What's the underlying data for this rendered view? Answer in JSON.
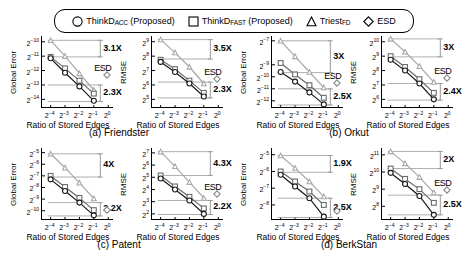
{
  "legend": {
    "items": [
      {
        "marker": "circle",
        "label_main": "ThinkD",
        "label_sub": "ACC",
        "label_tail": " (Proposed)",
        "name": "legend-thinkd-acc"
      },
      {
        "marker": "square",
        "label_main": "ThinkD",
        "label_sub": "FAST",
        "label_tail": " (Proposed)",
        "name": "legend-thinkd-fast"
      },
      {
        "marker": "triangle",
        "label_main": "Triest",
        "label_sub": "FD",
        "label_tail": "",
        "name": "legend-triest-fd"
      },
      {
        "marker": "diamond",
        "label_main": "ESD",
        "label_sub": "",
        "label_tail": "",
        "name": "legend-esd"
      }
    ]
  },
  "captions": {
    "a": "(a) Friendster",
    "b": "(b) Orkut",
    "c": "(c) Patent",
    "d": "(d) BerkStan"
  },
  "axis": {
    "xlabel": "Ratio of Stored Edges",
    "ylabel_error": "Global Error",
    "ylabel_rmse": "RMSE",
    "xticks": [
      "2⁻⁴",
      "2⁻³",
      "2⁻²",
      "2⁻¹",
      "2⁰"
    ],
    "xtick_exponents": [
      -4,
      -3,
      -2,
      -1,
      0
    ]
  },
  "colors": {
    "thinkd_acc": "#1a1a1a",
    "thinkd_fast": "#6b6b6b",
    "triest_fd": "#a8a8a8",
    "esd": "#8c8c8c",
    "annotation": "#9a9a9a",
    "axis": "#000000"
  },
  "chart_data": [
    {
      "id": "friendster-global-error",
      "type": "line",
      "title": "",
      "xlabel": "Ratio of Stored Edges",
      "ylabel": "Global Error",
      "x": [
        -4,
        -3,
        -2,
        -1
      ],
      "xlim": [
        -4.6,
        0.4
      ],
      "yticks": [
        -10,
        -11,
        -12,
        -13,
        -14
      ],
      "ylim": [
        -14.6,
        -9.6
      ],
      "series": [
        {
          "name": "ThinkD_ACC",
          "marker": "circle",
          "values": [
            -11.15,
            -12.15,
            -13.1,
            -14.1
          ]
        },
        {
          "name": "ThinkD_FAST",
          "marker": "square",
          "values": [
            -11.05,
            -11.85,
            -12.7,
            -13.6
          ]
        },
        {
          "name": "Triest_FD",
          "marker": "triangle",
          "values": [
            -9.9,
            -11.0,
            -12.2,
            -13.35
          ]
        },
        {
          "name": "ESD",
          "marker": "diamond",
          "values": [
            null,
            null,
            null,
            null
          ]
        }
      ],
      "annotations": [
        {
          "text": "3.1X",
          "bracket_top": -9.9,
          "bracket_bottom": -11.05
        },
        {
          "text": "2.3X",
          "bracket_top": -13.0,
          "bracket_bottom": -14.15
        }
      ],
      "esd_offscale": {
        "label": "ESD",
        "x": 0,
        "y": -11.9
      }
    },
    {
      "id": "friendster-rmse",
      "type": "line",
      "title": "",
      "xlabel": "Ratio of Stored Edges",
      "ylabel": "RMSE",
      "x": [
        -4,
        -3,
        -2,
        -1
      ],
      "xlim": [
        -4.6,
        0.4
      ],
      "yticks": [
        9,
        8,
        7,
        6,
        5
      ],
      "ylim": [
        4.4,
        9.4
      ],
      "series": [
        {
          "name": "ThinkD_ACC",
          "marker": "circle",
          "values": [
            7.6,
            6.9,
            6.1,
            5.2
          ]
        },
        {
          "name": "ThinkD_FAST",
          "marker": "square",
          "values": [
            7.75,
            7.1,
            6.3,
            5.45
          ]
        },
        {
          "name": "Triest_FD",
          "marker": "triangle",
          "values": [
            9.15,
            8.25,
            7.25,
            6.1
          ]
        },
        {
          "name": "ESD",
          "marker": "diamond",
          "values": [
            null,
            null,
            null,
            null
          ]
        }
      ],
      "annotations": [
        {
          "text": "3.5X",
          "bracket_top": 9.15,
          "bracket_bottom": 7.8
        },
        {
          "text": "2.3X",
          "bracket_top": 6.2,
          "bracket_bottom": 5.1
        }
      ],
      "esd_offscale": {
        "label": "ESD",
        "x": 0,
        "y": 6.8
      }
    },
    {
      "id": "orkut-global-error",
      "type": "line",
      "title": "",
      "xlabel": "Ratio of Stored Edges",
      "ylabel": "Global Error",
      "x": [
        -4,
        -3,
        -2,
        -1
      ],
      "xlim": [
        -4.6,
        0.4
      ],
      "yticks": [
        -7,
        -9,
        -10,
        -11,
        -12
      ],
      "ylim": [
        -12.6,
        -6.6
      ],
      "series": [
        {
          "name": "ThinkD_ACC",
          "marker": "circle",
          "values": [
            -9.6,
            -10.4,
            -11.3,
            -12.3
          ]
        },
        {
          "name": "ThinkD_FAST",
          "marker": "square",
          "values": [
            -8.85,
            -9.8,
            -10.7,
            -11.75
          ]
        },
        {
          "name": "Triest_FD",
          "marker": "triangle",
          "values": [
            -7.0,
            -8.3,
            -9.6,
            -10.9
          ]
        },
        {
          "name": "ESD",
          "marker": "diamond",
          "values": [
            null,
            null,
            null,
            null
          ]
        }
      ],
      "annotations": [
        {
          "text": "3X",
          "bracket_top": -7.0,
          "bracket_bottom": -9.65
        },
        {
          "text": "2.5X",
          "bracket_top": -11.0,
          "bracket_bottom": -12.35
        }
      ],
      "esd_offscale": {
        "label": "ESD",
        "x": 0,
        "y": -10.0
      }
    },
    {
      "id": "orkut-rmse",
      "type": "line",
      "title": "",
      "xlabel": "Ratio of Stored Edges",
      "ylabel": "RMSE",
      "x": [
        -4,
        -3,
        -2,
        -1
      ],
      "xlim": [
        -4.6,
        0.4
      ],
      "yticks": [
        10,
        9,
        8,
        7,
        6
      ],
      "ylim": [
        5.4,
        10.4
      ],
      "series": [
        {
          "name": "ThinkD_ACC",
          "marker": "circle",
          "values": [
            8.75,
            8.0,
            7.1,
            6.0
          ]
        },
        {
          "name": "ThinkD_FAST",
          "marker": "square",
          "values": [
            9.0,
            8.25,
            7.4,
            6.45
          ]
        },
        {
          "name": "Triest_FD",
          "marker": "triangle",
          "values": [
            10.2,
            9.3,
            8.3,
            7.2
          ]
        },
        {
          "name": "ESD",
          "marker": "diamond",
          "values": [
            null,
            null,
            null,
            null
          ]
        }
      ],
      "annotations": [
        {
          "text": "3X",
          "bracket_top": 10.2,
          "bracket_bottom": 8.95
        },
        {
          "text": "2.4X",
          "bracket_top": 7.1,
          "bracket_bottom": 5.95
        }
      ],
      "esd_offscale": {
        "label": "ESD",
        "x": 0,
        "y": 7.9
      }
    },
    {
      "id": "patent-global-error",
      "type": "line",
      "title": "",
      "xlabel": "Ratio of Stored Edges",
      "ylabel": "Global Error",
      "x": [
        -4,
        -3,
        -2,
        -1
      ],
      "xlim": [
        -4.6,
        0.4
      ],
      "yticks": [
        -5,
        -6,
        -7,
        -8,
        -9,
        -10
      ],
      "ylim": [
        -10.8,
        -4.6
      ],
      "series": [
        {
          "name": "ThinkD_ACC",
          "marker": "circle",
          "values": [
            -7.3,
            -8.3,
            -9.3,
            -10.4
          ]
        },
        {
          "name": "ThinkD_FAST",
          "marker": "square",
          "values": [
            -7.0,
            -7.95,
            -8.9,
            -9.95
          ]
        },
        {
          "name": "Triest_FD",
          "marker": "triangle",
          "values": [
            -5.1,
            -6.3,
            -7.6,
            -8.95
          ]
        },
        {
          "name": "ESD",
          "marker": "diamond",
          "values": [
            null,
            null,
            null,
            null
          ]
        }
      ],
      "annotations": [
        {
          "text": "4X",
          "bracket_top": -5.1,
          "bracket_bottom": -7.1
        },
        {
          "text": "2.2X",
          "bracket_top": -9.3,
          "bracket_bottom": -10.45
        }
      ],
      "esd_offscale": {
        "label": "",
        "x": 0,
        "y": -9.4
      }
    },
    {
      "id": "patent-rmse",
      "type": "line",
      "title": "",
      "xlabel": "Ratio of Stored Edges",
      "ylabel": "RMSE",
      "x": [
        -4,
        -3,
        -2,
        -1
      ],
      "xlim": [
        -4.6,
        0.4
      ],
      "yticks": [
        7,
        6,
        5,
        4,
        3,
        2
      ],
      "ylim": [
        1.5,
        7.4
      ],
      "series": [
        {
          "name": "ThinkD_ACC",
          "marker": "circle",
          "values": [
            4.9,
            4.0,
            3.1,
            2.0
          ]
        },
        {
          "name": "ThinkD_FAST",
          "marker": "square",
          "values": [
            5.15,
            4.25,
            3.4,
            2.45
          ]
        },
        {
          "name": "Triest_FD",
          "marker": "triangle",
          "values": [
            7.1,
            5.9,
            4.6,
            3.3
          ]
        },
        {
          "name": "ESD",
          "marker": "diamond",
          "values": [
            null,
            null,
            null,
            null
          ]
        }
      ],
      "annotations": [
        {
          "text": "4.3X",
          "bracket_top": 7.1,
          "bracket_bottom": 5.15
        },
        {
          "text": "2.2X",
          "bracket_top": 3.1,
          "bracket_bottom": 1.95
        }
      ],
      "esd_offscale": {
        "label": "ESD",
        "x": 0,
        "y": 4.1
      }
    },
    {
      "id": "berkstan-global-error",
      "type": "line",
      "title": "",
      "xlabel": "Ratio of Stored Edges",
      "ylabel": "Global Error",
      "x": [
        -4,
        -3,
        -2,
        -1
      ],
      "xlim": [
        -4.6,
        0.4
      ],
      "yticks": [
        -5,
        -6,
        -7,
        -8
      ],
      "ylim": [
        -8.9,
        -4.6
      ],
      "series": [
        {
          "name": "ThinkD_ACC",
          "marker": "circle",
          "values": [
            -6.2,
            -6.9,
            -7.6,
            -8.7
          ]
        },
        {
          "name": "ThinkD_FAST",
          "marker": "square",
          "values": [
            -6.0,
            -6.6,
            -7.2,
            -8.0
          ]
        },
        {
          "name": "Triest_FD",
          "marker": "triangle",
          "values": [
            -5.05,
            -5.8,
            -6.6,
            -7.5
          ]
        },
        {
          "name": "ESD",
          "marker": "diamond",
          "values": [
            null,
            null,
            null,
            null
          ]
        }
      ],
      "annotations": [
        {
          "text": "1.9X",
          "bracket_top": -5.05,
          "bracket_bottom": -6.05
        },
        {
          "text": "2.5X",
          "bracket_top": -7.6,
          "bracket_bottom": -8.75
        }
      ],
      "esd_offscale": {
        "label": "",
        "x": 0,
        "y": -8.0
      }
    },
    {
      "id": "berkstan-rmse",
      "type": "line",
      "title": "",
      "xlabel": "Ratio of Stored Edges",
      "ylabel": "RMSE",
      "x": [
        -4,
        -3,
        -2,
        -1
      ],
      "xlim": [
        -4.6,
        0.4
      ],
      "yticks": [
        11,
        10,
        9,
        8
      ],
      "ylim": [
        7.2,
        11.4
      ],
      "series": [
        {
          "name": "ThinkD_ACC",
          "marker": "circle",
          "values": [
            9.95,
            9.3,
            8.6,
            7.5
          ]
        },
        {
          "name": "ThinkD_FAST",
          "marker": "square",
          "values": [
            10.2,
            9.6,
            9.0,
            8.2
          ]
        },
        {
          "name": "Triest_FD",
          "marker": "triangle",
          "values": [
            11.2,
            10.5,
            9.7,
            8.8
          ]
        },
        {
          "name": "ESD",
          "marker": "diamond",
          "values": [
            null,
            null,
            null,
            null
          ]
        }
      ],
      "annotations": [
        {
          "text": "2X",
          "bracket_top": 11.2,
          "bracket_bottom": 10.2
        },
        {
          "text": "2.5X",
          "bracket_top": 8.65,
          "bracket_bottom": 7.5
        }
      ],
      "esd_offscale": {
        "label": "ESD",
        "x": 0,
        "y": 9.3
      }
    }
  ]
}
